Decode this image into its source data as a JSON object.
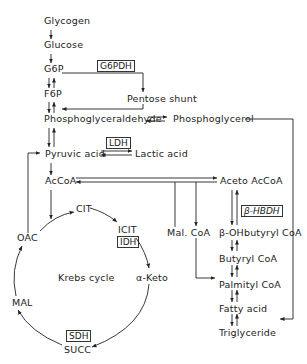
{
  "diagram": {
    "type": "metabolic-pathway",
    "glycolysis": {
      "glycogen": "Glycogen",
      "glucose": "Glucose",
      "g6p": "G6P",
      "f6p": "F6P",
      "phosphoglyceraldehyde": "Phosphoglyceraldehyde",
      "pyruvic_acid": "Pyruvic acid",
      "accoa": "AcCoA"
    },
    "pentose": {
      "enzyme": "G6PDH",
      "label": "Pentose shunt"
    },
    "phosphoglycerol": "Phosphoglycerol",
    "lactate": {
      "enzyme": "LDH",
      "label": "Lactic acid"
    },
    "krebs": {
      "title": "Krebs cycle",
      "cit": "CIT",
      "icit": "ICIT",
      "idh": "IDH",
      "aketo": "α-Keto",
      "succ": "SUCC",
      "sdh": "SDH",
      "mal": "MAL",
      "oac": "OAC"
    },
    "lipid": {
      "aceto_accoa": "Aceto AcCoA",
      "hbdh": "β-HBDH",
      "ohbutyryl": "β-OHbutyryl CoA",
      "butyryl": "Butyryl CoA",
      "mal_coa": "Mal. CoA",
      "palmityl": "Palmityl CoA",
      "fatty_acid": "Fatty acid",
      "triglyceride": "Triglyceride"
    }
  }
}
